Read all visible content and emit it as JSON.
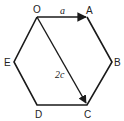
{
  "diagram": {
    "type": "regular-hexagon-vectors",
    "vertices": {
      "O": {
        "label": "O",
        "x": 37,
        "y": 17
      },
      "A": {
        "label": "A",
        "x": 87,
        "y": 17
      },
      "B": {
        "label": "B",
        "x": 112,
        "y": 62
      },
      "C": {
        "label": "C",
        "x": 87,
        "y": 105
      },
      "D": {
        "label": "D",
        "x": 37,
        "y": 105
      },
      "E": {
        "label": "E",
        "x": 14,
        "y": 62
      }
    },
    "vectors": [
      {
        "from": "O",
        "to": "A",
        "label": "a"
      },
      {
        "from": "O",
        "to": "C",
        "label": "2c"
      }
    ],
    "colors": {
      "stroke": "#1a1a1a",
      "text": "#222222",
      "background": "#ffffff"
    }
  }
}
